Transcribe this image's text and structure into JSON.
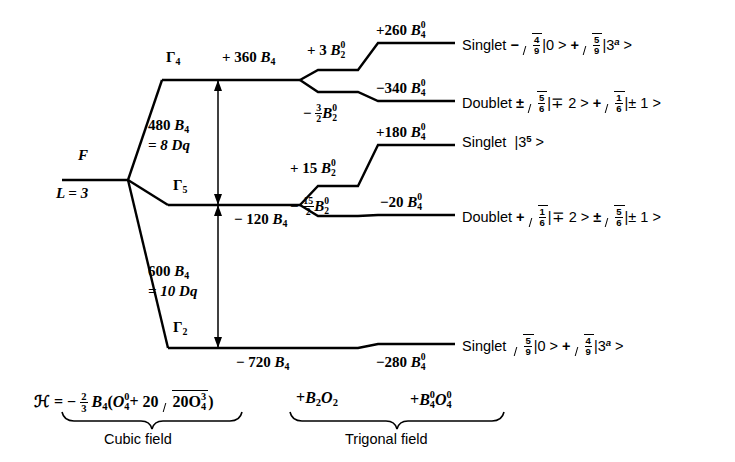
{
  "figure": {
    "type": "energy-level-splitting-diagram"
  },
  "free_ion": {
    "term": "F",
    "orbital": "L = 3"
  },
  "cubic_levels": [
    {
      "symmetry": "Γ",
      "symmetry_sub": "4",
      "energy_sign": "+",
      "energy": "360",
      "energy_unit": "B",
      "energy_unit_sub": "4",
      "label": "+ 360 B4"
    },
    {
      "symmetry": "Γ",
      "symmetry_sub": "5",
      "energy_sign": "−",
      "energy": "120",
      "energy_unit": "B",
      "energy_unit_sub": "4",
      "label": "− 120 B4"
    },
    {
      "symmetry": "Γ",
      "symmetry_sub": "2",
      "energy_sign": "−",
      "energy": "720",
      "energy_unit": "B",
      "energy_unit_sub": "4",
      "label": "− 720 B4"
    }
  ],
  "gaps": [
    {
      "value": "480",
      "unit": "B",
      "unit_sub": "4",
      "equals": "= 8 Dq"
    },
    {
      "value": "600",
      "unit": "B",
      "unit_sub": "4",
      "equals": "= 10 Dq"
    }
  ],
  "trigonal_shifts": [
    {
      "sign": "+",
      "coeff": "3",
      "coeff_is_fraction": false,
      "num": "",
      "den": "",
      "unit": "B",
      "sub": "2",
      "sup": "0"
    },
    {
      "sign": "−",
      "coeff": "",
      "coeff_is_fraction": true,
      "num": "3",
      "den": "2",
      "unit": "B",
      "sub": "2",
      "sup": "0"
    },
    {
      "sign": "+",
      "coeff": "15",
      "coeff_is_fraction": false,
      "num": "",
      "den": "",
      "unit": "B",
      "sub": "2",
      "sup": "0"
    },
    {
      "sign": "−",
      "coeff": "",
      "coeff_is_fraction": true,
      "num": "15",
      "den": "2",
      "unit": "B",
      "sub": "2",
      "sup": "0"
    }
  ],
  "final_levels": [
    {
      "energy_sign": "+",
      "energy": "260",
      "unit": "B",
      "unit_sub": "4",
      "unit_sup": "0",
      "multiplicity": "Singlet",
      "state_lead": "−",
      "t1_num": "4",
      "t1_den": "9",
      "t1_ket": "|0 >",
      "joiner": "+",
      "t2_num": "5",
      "t2_den": "9",
      "t2_ket": "|3",
      "t2_ket_sup": "a",
      "t2_ket_tail": " >"
    },
    {
      "energy_sign": "−",
      "energy": "340",
      "unit": "B",
      "unit_sub": "4",
      "unit_sup": "0",
      "multiplicity": "Doublet",
      "state_lead": "±",
      "t1_num": "5",
      "t1_den": "6",
      "t1_ket": "|∓ 2 >",
      "joiner": "+",
      "t2_num": "1",
      "t2_den": "6",
      "t2_ket": "|± 1 >",
      "t2_ket_sup": "",
      "t2_ket_tail": ""
    },
    {
      "energy_sign": "+",
      "energy": "180",
      "unit": "B",
      "unit_sub": "4",
      "unit_sup": "0",
      "multiplicity": "Singlet",
      "state_lead": "",
      "t1_num": "",
      "t1_den": "",
      "t1_ket": "|3",
      "joiner": "",
      "t2_num": "",
      "t2_den": "",
      "t2_ket": "",
      "t2_ket_sup": "5",
      "t2_ket_tail": " >",
      "simple_ket": true
    },
    {
      "energy_sign": "−",
      "energy": "20",
      "unit": "B",
      "unit_sub": "4",
      "unit_sup": "0",
      "multiplicity": "Doublet",
      "state_lead": "+",
      "t1_num": "1",
      "t1_den": "6",
      "t1_ket": "|∓ 2 >",
      "joiner": "±",
      "t2_num": "5",
      "t2_den": "6",
      "t2_ket": "|± 1 >",
      "t2_ket_sup": "",
      "t2_ket_tail": ""
    },
    {
      "energy_sign": "−",
      "energy": "280",
      "unit": "B",
      "unit_sub": "4",
      "unit_sup": "0",
      "multiplicity": "Singlet",
      "state_lead": "",
      "t1_num": "5",
      "t1_den": "9",
      "t1_ket": "|0 >",
      "joiner": "+",
      "t2_num": "4",
      "t2_den": "9",
      "t2_ket": "|3",
      "t2_ket_sup": "a",
      "t2_ket_tail": " >"
    }
  ],
  "hamiltonian": {
    "symbol": "ℋ",
    "equals": "= −",
    "frac_num": "2",
    "frac_den": "3",
    "b4": "B",
    "b4_sub": "4",
    "open_paren": "(",
    "o40": "O",
    "o40_sub": "4",
    "o40_sup": "0",
    "plus": "+ 20",
    "sqrt_val": "20",
    "o43": "O",
    "o43_sub": "4",
    "o43_sup": "3",
    "close_paren": ")",
    "trig_term1_sign": "+",
    "trig_term1_b": "B",
    "trig_term1_b_sub": "2",
    "trig_term1_o": "O",
    "trig_term1_o_sub": "2",
    "trig_term2_sign": "+",
    "trig_term2_b": "B",
    "trig_term2_b_sub": "4",
    "trig_term2_b_sup": "0",
    "trig_term2_o": "O",
    "trig_term2_o_sub": "4",
    "trig_term2_o_sup": "0"
  },
  "braces": {
    "cubic_label": "Cubic field",
    "trigonal_label": "Trigonal field"
  },
  "style": {
    "line_color": "#000000",
    "background": "#ffffff"
  }
}
